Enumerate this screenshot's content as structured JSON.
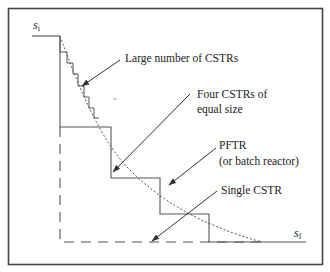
{
  "diagram": {
    "type": "reactor-staging-comparison",
    "axis_labels": {
      "start": "s",
      "start_sub": "i",
      "end": "s",
      "end_sub": "f"
    },
    "annotations": [
      {
        "id": "large",
        "text": "Large number of CSTRs"
      },
      {
        "id": "four_line1",
        "text": "Four CSTRs of"
      },
      {
        "id": "four_line2",
        "text": "equal size"
      },
      {
        "id": "pftr_line1",
        "text": "PFTR"
      },
      {
        "id": "pftr_line2",
        "text": "(or batch reactor)"
      },
      {
        "id": "single",
        "text": "Single CSTR"
      }
    ],
    "curves": [
      {
        "name": "PFTR (or batch reactor)",
        "style": "dotted"
      },
      {
        "name": "Large number of CSTRs",
        "style": "fine staircase"
      },
      {
        "name": "Four CSTRs of equal size",
        "style": "solid staircase",
        "steps": 4
      },
      {
        "name": "Single CSTR",
        "style": "dashed"
      }
    ],
    "colors": {
      "line": "#555555",
      "text": "#222222",
      "frame": "#444444"
    }
  }
}
